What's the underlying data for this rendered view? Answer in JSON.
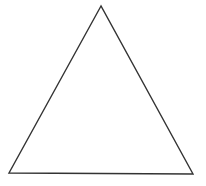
{
  "diagram": {
    "shape": "triangle",
    "kind": "equilateral-outline",
    "vertices": [
      {
        "name": "apex",
        "x": 101,
        "y": 6
      },
      {
        "name": "bottom-left",
        "x": 9,
        "y": 173
      },
      {
        "name": "bottom-right",
        "x": 193,
        "y": 174
      }
    ],
    "stroke_color": "#333333",
    "fill_color": "none",
    "background_color": "#ffffff",
    "stroke_width": 1.4
  }
}
